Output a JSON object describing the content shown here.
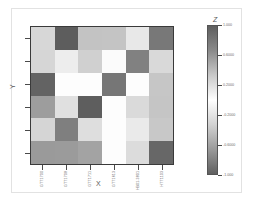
{
  "figure": {
    "background_color": "#ffffff",
    "frame_color": "#e2e2e2"
  },
  "axes": {
    "x_label": "X",
    "y_label": "Y",
    "x_tick_labels": [
      "GTT1700",
      "GTT1708",
      "GTT1711",
      "GTT1613",
      "HB01-3801",
      "HTT1103"
    ],
    "y_tick_labels": [
      "",
      "",
      "",
      "",
      "",
      ""
    ],
    "border_color": "#3a3a3a",
    "tick_color": "#4a4a4a"
  },
  "colorbar": {
    "title": "Z",
    "tick_labels": [
      "1.000",
      "0.6000",
      "0.2000",
      "-0.2000",
      "-0.6000",
      "-1.000"
    ],
    "tick_values": [
      1.0,
      0.6,
      0.2,
      -0.2,
      -0.6,
      -1.0
    ],
    "vmin": -1.0,
    "vmax": 1.0,
    "gradient_stops": [
      "#5f5f5f",
      "#8a8a8a",
      "#c9c9c9",
      "#ffffff",
      "#d2d2d2",
      "#9a9a9a",
      "#606060"
    ]
  },
  "chart_data": {
    "type": "heatmap",
    "title": "",
    "xlabel": "X",
    "ylabel": "Y",
    "zlabel": "Z",
    "grid": false,
    "legend_position": "right",
    "x_categories": [
      "GTT1700",
      "GTT1708",
      "GTT1711",
      "GTT1613",
      "HB01-3801",
      "HTT1103"
    ],
    "y_categories": [
      "r1",
      "r2",
      "r3",
      "r4",
      "r5",
      "r6"
    ],
    "zlim": [
      -1.0,
      1.0
    ],
    "values": [
      [
        0.24,
        -0.86,
        0.32,
        0.3,
        0.6,
        -0.62
      ],
      [
        0.4,
        0.64,
        0.36,
        0.94,
        -0.56,
        0.44
      ],
      [
        -0.8,
        0.96,
        0.96,
        -0.66,
        0.96,
        0.3
      ],
      [
        -0.36,
        0.52,
        -0.84,
        0.98,
        0.46,
        0.28
      ],
      [
        0.26,
        -0.58,
        0.48,
        0.98,
        0.66,
        0.3
      ],
      [
        -0.34,
        -0.4,
        -0.3,
        0.98,
        0.52,
        -0.78
      ]
    ],
    "cell_colors": [
      [
        "#d7d7d7",
        "#5d5d5d",
        "#c3c3c3",
        "#c4c4c4",
        "#e8e8e8",
        "#787878"
      ],
      [
        "#d6d6d6",
        "#ededed",
        "#d0d0d0",
        "#fbfbfb",
        "#818181",
        "#d9d9d9"
      ],
      [
        "#636363",
        "#fdfdfd",
        "#fdfdfd",
        "#767676",
        "#fdfdfd",
        "#c6c6c6"
      ],
      [
        "#9d9d9d",
        "#e0e0e0",
        "#5e5e5e",
        "#fdfdfd",
        "#dadada",
        "#c5c5c5"
      ],
      [
        "#d5d5d5",
        "#7f7f7f",
        "#dedede",
        "#fdfdfd",
        "#eaeaea",
        "#c8c8c8"
      ],
      [
        "#9a9a9a",
        "#9b9b9b",
        "#a3a3a3",
        "#fdfdfd",
        "#dcdcdc",
        "#676767"
      ]
    ]
  }
}
